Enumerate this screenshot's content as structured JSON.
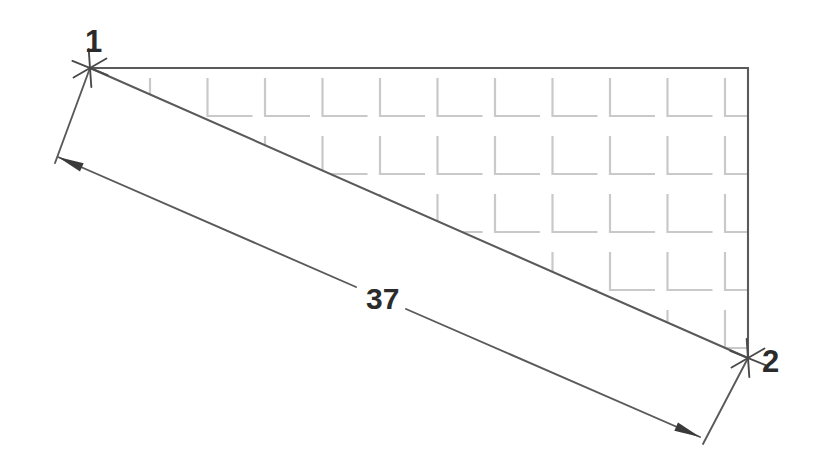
{
  "drawing": {
    "title": "Dimensioned triangular hatched region",
    "background_color": "#ffffff",
    "width": 822,
    "height": 471,
    "outline_color": "#5a5a5a",
    "hatch_color": "#c9c9c9",
    "text_color": "#2b2b2b"
  },
  "vertices": [
    {
      "id": "1",
      "label": "1",
      "x": 90,
      "y": 68,
      "label_x": 85,
      "label_y": 52,
      "marker": "cross-mark"
    },
    {
      "id": "2",
      "label": "2",
      "x": 748,
      "y": 358,
      "label_x": 762,
      "label_y": 372,
      "marker": "cross-mark"
    }
  ],
  "shape": {
    "name": "triangle-outline",
    "points": "90,68 748,68 748,358",
    "top_edge": {
      "x1": 90,
      "y1": 68,
      "x2": 748,
      "y2": 68
    },
    "right_edge": {
      "x1": 748,
      "y1": 68,
      "x2": 748,
      "y2": 358
    },
    "diagonal_edge": {
      "x1": 90,
      "y1": 68,
      "x2": 748,
      "y2": 358
    }
  },
  "hatch": {
    "pattern": "l-bracket-grid",
    "columns": 11,
    "rows": 6,
    "origin_x": 150,
    "origin_y": 78,
    "step_x": 57.5,
    "step_y": 58,
    "arm_vertical": 38,
    "arm_horizontal": 45
  },
  "dimension": {
    "label": "37",
    "label_x": 366,
    "label_y": 309,
    "line": {
      "x1": 58,
      "y1": 157,
      "x2": 700,
      "y2": 437
    },
    "gap_start": {
      "x": 356,
      "y": 287
    },
    "gap_end": {
      "x": 406,
      "y": 309
    },
    "arrow_start": {
      "x": 58,
      "y": 157
    },
    "arrow_end": {
      "x": 700,
      "y": 437
    },
    "extension_line_1": {
      "x1": 90,
      "y1": 68,
      "x2": 55,
      "y2": 163
    },
    "extension_line_2": {
      "x1": 748,
      "y1": 358,
      "x2": 703,
      "y2": 444
    }
  }
}
